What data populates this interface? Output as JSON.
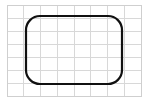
{
  "figure": {
    "canvas": {
      "width": 147,
      "height": 104,
      "background_color": "#ffffff"
    },
    "grid": {
      "name": "graph-paper-grid",
      "line_color": "#d8d8d8",
      "border_color": "#cfcfcf",
      "line_width": 1,
      "origin_x": 7,
      "origin_y": 5,
      "cell_width": 16.75,
      "cell_height": 13,
      "columns": 8,
      "rows": 7,
      "right_x": 141,
      "bottom_y": 96,
      "vertical_line_positions": [
        7,
        23.75,
        40.5,
        57.25,
        74,
        90.75,
        107.5,
        124.25,
        141
      ],
      "horizontal_line_positions": [
        5,
        18,
        31,
        44,
        57,
        70,
        83,
        96
      ]
    },
    "shape": {
      "name": "rounded-rectangle",
      "type": "rounded-rect-outline",
      "stroke_color": "#111111",
      "fill_color": "none",
      "stroke_width": 2.2,
      "x": 26,
      "y": 16,
      "width": 96,
      "height": 68,
      "corner_radius": 14,
      "left_edge_x": 26,
      "right_edge_x": 122,
      "top_edge_y": 16,
      "bottom_edge_y": 84
    }
  }
}
